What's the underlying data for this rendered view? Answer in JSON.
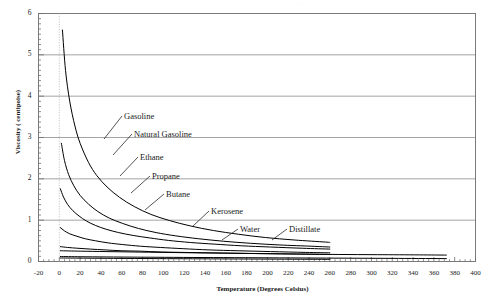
{
  "figure": {
    "ghost_header": ". .",
    "background": "#ffffff",
    "frame_color": "#7a7a7a",
    "grid_color": "#9a9a9a",
    "curve_color": "#000000"
  },
  "chart_data": {
    "type": "line",
    "title": "",
    "xlabel": "Temperature (Degrees Celsius)",
    "ylabel": "Viscosity ( centipoise)",
    "xlim": [
      -20,
      400
    ],
    "ylim": [
      0,
      6
    ],
    "xticks": [
      -20,
      0,
      20,
      40,
      60,
      80,
      100,
      120,
      140,
      160,
      180,
      200,
      220,
      240,
      260,
      280,
      300,
      320,
      340,
      360,
      380,
      400
    ],
    "yticks": [
      0,
      1,
      2,
      3,
      4,
      5,
      6
    ],
    "grid": "horizontal",
    "legend": "inline-annotations",
    "series": [
      {
        "name": "Gasoline",
        "label_x": 124,
        "label_y": 111,
        "leader": [
          [
            122,
            116
          ],
          [
            104,
            139
          ]
        ],
        "points": [
          [
            3,
            5.6
          ],
          [
            6,
            4.62
          ],
          [
            10,
            3.88
          ],
          [
            15,
            3.28
          ],
          [
            20,
            2.86
          ],
          [
            28,
            2.4
          ],
          [
            36,
            2.08
          ],
          [
            46,
            1.8
          ],
          [
            58,
            1.55
          ],
          [
            72,
            1.33
          ],
          [
            88,
            1.14
          ],
          [
            106,
            0.99
          ],
          [
            126,
            0.86
          ],
          [
            148,
            0.75
          ],
          [
            172,
            0.66
          ],
          [
            198,
            0.58
          ],
          [
            226,
            0.52
          ],
          [
            256,
            0.47
          ],
          [
            260,
            0.46
          ]
        ]
      },
      {
        "name": "Natural Gasoline",
        "label_x": 134,
        "label_y": 129,
        "leader": [
          [
            132,
            134
          ],
          [
            113,
            155
          ]
        ],
        "points": [
          [
            2,
            2.86
          ],
          [
            5,
            2.44
          ],
          [
            9,
            2.1
          ],
          [
            14,
            1.83
          ],
          [
            20,
            1.6
          ],
          [
            28,
            1.39
          ],
          [
            37,
            1.21
          ],
          [
            48,
            1.05
          ],
          [
            61,
            0.92
          ],
          [
            76,
            0.8
          ],
          [
            93,
            0.7
          ],
          [
            112,
            0.62
          ],
          [
            134,
            0.55
          ],
          [
            158,
            0.49
          ],
          [
            184,
            0.44
          ],
          [
            212,
            0.4
          ],
          [
            242,
            0.37
          ],
          [
            260,
            0.35
          ]
        ]
      },
      {
        "name": "Ethane",
        "label_x": 140,
        "label_y": 152,
        "leader": [
          [
            138,
            157
          ],
          [
            120,
            176
          ]
        ],
        "points": [
          [
            1,
            1.76
          ],
          [
            4,
            1.56
          ],
          [
            8,
            1.38
          ],
          [
            13,
            1.23
          ],
          [
            19,
            1.1
          ],
          [
            26,
            0.98
          ],
          [
            35,
            0.87
          ],
          [
            45,
            0.78
          ],
          [
            57,
            0.7
          ],
          [
            71,
            0.63
          ],
          [
            87,
            0.57
          ],
          [
            105,
            0.51
          ],
          [
            126,
            0.46
          ],
          [
            149,
            0.42
          ],
          [
            175,
            0.38
          ],
          [
            203,
            0.35
          ],
          [
            234,
            0.32
          ],
          [
            260,
            0.3
          ]
        ]
      },
      {
        "name": "Propane",
        "label_x": 152,
        "label_y": 171,
        "leader": [
          [
            150,
            176
          ],
          [
            131,
            193
          ]
        ],
        "points": [
          [
            1,
            0.82
          ],
          [
            5,
            0.74
          ],
          [
            10,
            0.67
          ],
          [
            17,
            0.61
          ],
          [
            25,
            0.55
          ],
          [
            35,
            0.5
          ],
          [
            47,
            0.45
          ],
          [
            61,
            0.41
          ],
          [
            78,
            0.37
          ],
          [
            97,
            0.34
          ],
          [
            119,
            0.31
          ],
          [
            144,
            0.28
          ],
          [
            172,
            0.26
          ],
          [
            203,
            0.24
          ],
          [
            237,
            0.22
          ],
          [
            260,
            0.21
          ]
        ]
      },
      {
        "name": "Butane",
        "label_x": 166,
        "label_y": 189,
        "leader": [
          [
            164,
            194
          ],
          [
            145,
            210
          ]
        ],
        "points": [
          [
            1,
            0.36
          ],
          [
            8,
            0.34
          ],
          [
            18,
            0.32
          ],
          [
            30,
            0.3
          ],
          [
            44,
            0.28
          ],
          [
            60,
            0.26
          ],
          [
            78,
            0.25
          ],
          [
            98,
            0.23
          ],
          [
            120,
            0.22
          ],
          [
            144,
            0.21
          ],
          [
            170,
            0.2
          ],
          [
            198,
            0.19
          ],
          [
            228,
            0.18
          ],
          [
            260,
            0.17
          ]
        ]
      },
      {
        "name": "Kerosene",
        "label_x": 211,
        "label_y": 206,
        "leader": [
          [
            209,
            211
          ],
          [
            193,
            226
          ]
        ],
        "points": [
          [
            1,
            0.26
          ],
          [
            20,
            0.25
          ],
          [
            45,
            0.24
          ],
          [
            72,
            0.23
          ],
          [
            100,
            0.22
          ],
          [
            130,
            0.21
          ],
          [
            162,
            0.2
          ],
          [
            196,
            0.19
          ],
          [
            232,
            0.18
          ],
          [
            268,
            0.17
          ],
          [
            306,
            0.165
          ],
          [
            346,
            0.16
          ],
          [
            372,
            0.155
          ]
        ]
      },
      {
        "name": "Water",
        "label_x": 240,
        "label_y": 224,
        "leader": [
          [
            238,
            229
          ],
          [
            222,
            240
          ]
        ],
        "points": [
          [
            1,
            0.12
          ],
          [
            20,
            0.115
          ],
          [
            45,
            0.11
          ],
          [
            75,
            0.105
          ],
          [
            110,
            0.1
          ],
          [
            148,
            0.095
          ],
          [
            190,
            0.09
          ],
          [
            234,
            0.085
          ],
          [
            280,
            0.08
          ],
          [
            326,
            0.075
          ],
          [
            372,
            0.07
          ]
        ]
      },
      {
        "name": "Distillate",
        "label_x": 289,
        "label_y": 224,
        "leader": [
          [
            287,
            229
          ],
          [
            272,
            240
          ]
        ],
        "points": [
          [
            1,
            0.085
          ],
          [
            18,
            0.082
          ],
          [
            40,
            0.078
          ],
          [
            65,
            0.074
          ],
          [
            95,
            0.07
          ],
          [
            128,
            0.066
          ],
          [
            163,
            0.062
          ],
          [
            200,
            0.058
          ],
          [
            232,
            0.055
          ],
          [
            260,
            0.052
          ]
        ]
      }
    ]
  }
}
